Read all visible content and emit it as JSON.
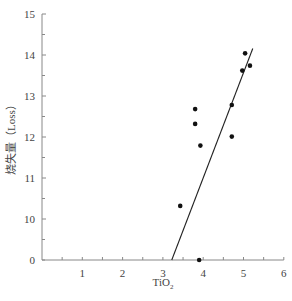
{
  "chart_data": {
    "type": "scatter",
    "title": "",
    "xlabel": "TiO₂",
    "ylabel": "烧失量（Loss）",
    "xlim": [
      0,
      6
    ],
    "ylim": [
      0,
      15
    ],
    "y_axis_break": {
      "from": 0,
      "to": 10
    },
    "x_ticks": [
      1,
      2,
      3,
      4,
      5,
      6
    ],
    "y_tick_labels": [
      "0",
      "10",
      "11",
      "12",
      "13",
      "14",
      "15"
    ],
    "grid": false,
    "legend": null,
    "series": [
      {
        "name": "samples",
        "points": [
          {
            "x": 3.8,
            "y": 12.68
          },
          {
            "x": 3.8,
            "y": 12.32
          },
          {
            "x": 4.71,
            "y": 12.78
          },
          {
            "x": 4.71,
            "y": 12.01
          },
          {
            "x": 3.93,
            "y": 11.79
          },
          {
            "x": 3.43,
            "y": 10.32
          },
          {
            "x": 3.9,
            "y": 9.76
          },
          {
            "x": 5.04,
            "y": 14.04
          },
          {
            "x": 4.97,
            "y": 13.62
          },
          {
            "x": 5.16,
            "y": 13.74
          }
        ]
      }
    ],
    "trendline": {
      "x1": 3.22,
      "y1": 9.85,
      "x2": 5.23,
      "y2": 14.16
    }
  },
  "colors": {
    "axis": "#888888",
    "points": "#111111",
    "line": "#222222",
    "text": "#444444"
  }
}
